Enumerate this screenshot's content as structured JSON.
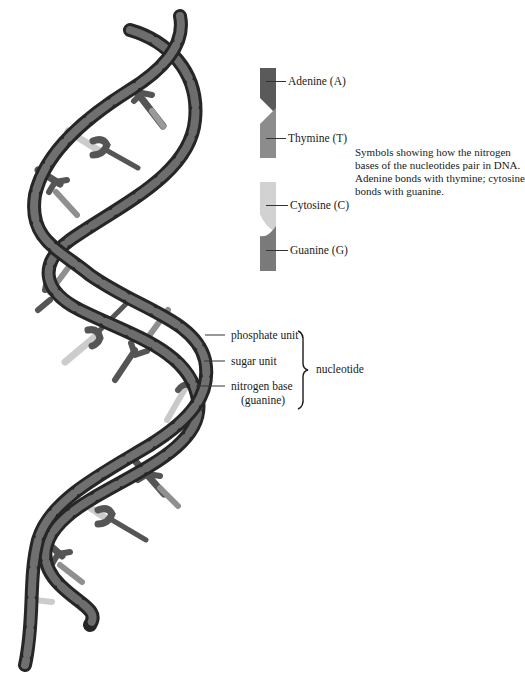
{
  "legend": {
    "items": [
      {
        "key": "adenine",
        "label": "Adenine (A)",
        "color": "#5a5a5a"
      },
      {
        "key": "thymine",
        "label": "Thymine (T)",
        "color": "#8c8c8c"
      },
      {
        "key": "cytosine",
        "label": "Cytosine (C)",
        "color": "#d2d2d2"
      },
      {
        "key": "guanine",
        "label": "Guanine (G)",
        "color": "#7a7a7a"
      }
    ],
    "note": "Symbols showing how the nitrogen bases of the nucleotides pair in DNA. Adenine bonds with thymine; cytosine bonds with guanine."
  },
  "nucleotide": {
    "parts": [
      {
        "key": "phosphate",
        "label": "phosphate unit"
      },
      {
        "key": "sugar",
        "label": "sugar unit"
      },
      {
        "key": "base",
        "label": "nitrogen base",
        "sublabel": "(guanine)"
      }
    ],
    "group_label": "nucleotide"
  },
  "colors": {
    "strand_dark": "#2e2e2e",
    "strand_mid": "#6e6e6e",
    "strand_band": "#1c1c1c",
    "base_light": "#c9c9c9",
    "base_dark": "#4f4f4f"
  }
}
